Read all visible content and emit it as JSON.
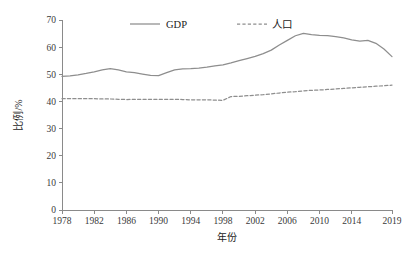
{
  "chart_data": {
    "type": "line",
    "title": "",
    "xlabel": "年份",
    "ylabel": "比例/%",
    "xlim": [
      1978,
      2019
    ],
    "ylim": [
      0,
      70
    ],
    "grid": false,
    "legend_position": "top-center",
    "x_ticks": [
      "1978",
      "1982",
      "1986",
      "1990",
      "1994",
      "1998",
      "2002",
      "2006",
      "2010",
      "2014",
      "2019"
    ],
    "x_tick_values": [
      1978,
      1982,
      1986,
      1990,
      1994,
      1998,
      2002,
      2006,
      2010,
      2014,
      2019
    ],
    "y_ticks": [
      "0",
      "10",
      "20",
      "30",
      "40",
      "50",
      "60",
      "70"
    ],
    "y_tick_values": [
      0,
      10,
      20,
      30,
      40,
      50,
      60,
      70
    ],
    "x": [
      1978,
      1979,
      1980,
      1981,
      1982,
      1983,
      1984,
      1985,
      1986,
      1987,
      1988,
      1989,
      1990,
      1991,
      1992,
      1993,
      1994,
      1995,
      1996,
      1997,
      1998,
      1999,
      2000,
      2001,
      2002,
      2003,
      2004,
      2005,
      2006,
      2007,
      2008,
      2009,
      2010,
      2011,
      2012,
      2013,
      2014,
      2015,
      2016,
      2017,
      2018,
      2019
    ],
    "series": [
      {
        "name": "GDP",
        "style": "solid",
        "color": "#8e8e8e",
        "values": [
          49.2,
          49.4,
          49.8,
          50.3,
          50.9,
          51.6,
          52.1,
          51.6,
          50.9,
          50.6,
          50.1,
          49.6,
          49.5,
          50.6,
          51.6,
          52.0,
          52.1,
          52.3,
          52.6,
          53.1,
          53.5,
          54.2,
          55.0,
          55.8,
          56.6,
          57.6,
          58.9,
          60.8,
          62.5,
          64.2,
          65.1,
          64.6,
          64.3,
          64.2,
          63.9,
          63.4,
          62.7,
          62.2,
          62.5,
          61.4,
          59.3,
          56.5
        ]
      },
      {
        "name": "人口",
        "style": "dashed",
        "color": "#8e8e8e",
        "values": [
          41.0,
          41.0,
          41.0,
          41.0,
          41.0,
          40.9,
          40.9,
          40.8,
          40.7,
          40.8,
          40.8,
          40.8,
          40.8,
          40.8,
          40.8,
          40.7,
          40.6,
          40.6,
          40.6,
          40.5,
          40.4,
          41.8,
          41.9,
          42.1,
          42.3,
          42.5,
          42.8,
          43.1,
          43.4,
          43.6,
          43.9,
          44.1,
          44.2,
          44.4,
          44.6,
          44.8,
          45.0,
          45.2,
          45.4,
          45.6,
          45.8,
          46.0
        ]
      }
    ],
    "legend": [
      {
        "label": "GDP",
        "style": "solid"
      },
      {
        "label": "人口",
        "style": "dashed"
      }
    ]
  },
  "axes": {
    "x_title": "年份",
    "y_title": "比例/%"
  }
}
